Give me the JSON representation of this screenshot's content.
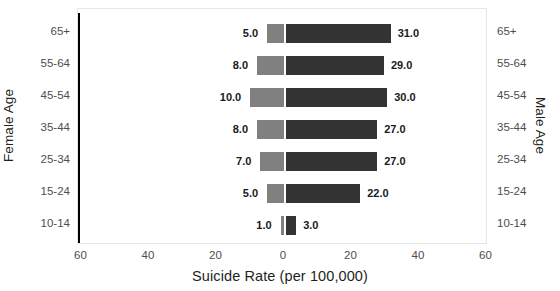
{
  "chart_data": {
    "type": "bar",
    "subtype": "diverging-population-pyramid",
    "title": "",
    "xlabel": "Suicide Rate (per 100,000)",
    "ylabel_left": "Female Age",
    "ylabel_right": "Male Age",
    "categories": [
      "65+",
      "55-64",
      "45-54",
      "35-44",
      "25-34",
      "15-24",
      "10-14"
    ],
    "series": [
      {
        "name": "Female",
        "direction": "left",
        "color": "#808080",
        "values": [
          5.0,
          8.0,
          10.0,
          8.0,
          7.0,
          5.0,
          1.0
        ],
        "labels": [
          "5.0",
          "8.0",
          "10.0",
          "8.0",
          "7.0",
          "5.0",
          "1.0"
        ]
      },
      {
        "name": "Male",
        "direction": "right",
        "color": "#333333",
        "values": [
          31.0,
          29.0,
          30.0,
          27.0,
          27.0,
          22.0,
          3.0
        ],
        "labels": [
          "31.0",
          "29.0",
          "30.0",
          "27.0",
          "27.0",
          "22.0",
          "3.0"
        ]
      }
    ],
    "xlim": [
      -70,
      70
    ],
    "xticks": [
      -60,
      -40,
      -20,
      0,
      20,
      40,
      60
    ],
    "xtick_labels": [
      "60",
      "40",
      "20",
      "0",
      "20",
      "40",
      "60"
    ],
    "grid": false,
    "legend": "none",
    "zero_line_color": "#000000",
    "frame_color": "#e6e6e6"
  }
}
